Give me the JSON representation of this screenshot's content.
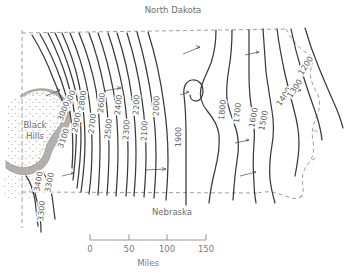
{
  "figure": {
    "type": "contour-map",
    "title_visible": false,
    "region": "South Dakota"
  },
  "labels": {
    "north_dakota": "North Dakota",
    "nebraska": "Nebraska",
    "black_hills_line1": "Black",
    "black_hills_line2": "Hills"
  },
  "scale_bar": {
    "ticks": [
      "0",
      "50",
      "100",
      "150"
    ],
    "units_label": "Miles",
    "tick_values": [
      0,
      50,
      100,
      150
    ]
  },
  "colors": {
    "contour_line": "#3a3a3a",
    "boundary_dashed": "#9a9a9a",
    "black_hills_band": "#b4b0ac",
    "stipple": "#9b9b9b",
    "text": "#6b6b6b",
    "background": "#ffffff"
  },
  "chart_data": {
    "type": "contour",
    "title": "",
    "xlabel": "",
    "ylabel": "",
    "units": "feet above sea level",
    "contour_interval": 100,
    "value_range": [
      1200,
      3400
    ],
    "contour_labels": [
      "3400",
      "3300",
      "3300",
      "3100",
      "3000",
      "3000",
      "2900",
      "2800",
      "2700",
      "2600",
      "2500",
      "2400",
      "2300",
      "2200",
      "2100",
      "2000",
      "1900",
      "1800",
      "1700",
      "1600",
      "1500",
      "1400",
      "1300",
      "1200"
    ],
    "levels_west": [
      3400,
      3300,
      3200,
      3100,
      3000,
      2900,
      2800,
      2700,
      2600,
      2500,
      2400,
      2300,
      2200,
      2100,
      2000
    ],
    "levels_east": [
      1900,
      1800,
      1700,
      1600,
      1500,
      1400,
      1300,
      1200
    ],
    "legend": [],
    "grid": false,
    "annotations": [
      {
        "text": "North Dakota",
        "position": "top-center"
      },
      {
        "text": "Nebraska",
        "position": "bottom-center"
      },
      {
        "text": "Black Hills",
        "position": "left-center"
      }
    ]
  },
  "contour_label_positions": [
    {
      "value": "3000",
      "x": 72,
      "y": 101,
      "rot": -68
    },
    {
      "value": "3000",
      "x": 66,
      "y": 112,
      "rot": -70
    },
    {
      "value": "2900",
      "x": 79,
      "y": 123,
      "rot": -78
    },
    {
      "value": "2800",
      "x": 85,
      "y": 101,
      "rot": -82
    },
    {
      "value": "3100",
      "x": 66,
      "y": 139,
      "rot": -72
    },
    {
      "value": "2700",
      "x": 95,
      "y": 124,
      "rot": -83
    },
    {
      "value": "2600",
      "x": 104,
      "y": 103,
      "rot": -84
    },
    {
      "value": "2500",
      "x": 111,
      "y": 129,
      "rot": -85
    },
    {
      "value": "2400",
      "x": 121,
      "y": 105,
      "rot": -85
    },
    {
      "value": "2300",
      "x": 129,
      "y": 130,
      "rot": -86
    },
    {
      "value": "2200",
      "x": 139,
      "y": 105,
      "rot": -86
    },
    {
      "value": "2100",
      "x": 147,
      "y": 131,
      "rot": -87
    },
    {
      "value": "2000",
      "x": 159,
      "y": 106,
      "rot": -87
    },
    {
      "value": "1900",
      "x": 181,
      "y": 137,
      "rot": -89
    },
    {
      "value": "1800",
      "x": 225,
      "y": 110,
      "rot": -85
    },
    {
      "value": "1700",
      "x": 240,
      "y": 113,
      "rot": -84
    },
    {
      "value": "1600",
      "x": 256,
      "y": 118,
      "rot": -80
    },
    {
      "value": "1500",
      "x": 266,
      "y": 121,
      "rot": -78
    },
    {
      "value": "1400",
      "x": 286,
      "y": 98,
      "rot": -56
    },
    {
      "value": "1300",
      "x": 297,
      "y": 90,
      "rot": -56
    },
    {
      "value": "1200",
      "x": 308,
      "y": 67,
      "rot": -58
    },
    {
      "value": "3400",
      "x": 41,
      "y": 182,
      "rot": -80
    },
    {
      "value": "3300",
      "x": 52,
      "y": 183,
      "rot": -80
    },
    {
      "value": "3300",
      "x": 44,
      "y": 211,
      "rot": -84
    }
  ]
}
